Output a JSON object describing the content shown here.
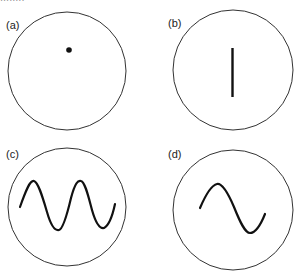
{
  "figure": {
    "cut_text": "........",
    "panels": [
      {
        "id": "a",
        "label": "(a)",
        "display": "dot"
      },
      {
        "id": "b",
        "label": "(b)",
        "display": "vertical-line"
      },
      {
        "id": "c",
        "label": "(c)",
        "display": "sine-wave-two-cycles"
      },
      {
        "id": "d",
        "label": "(d)",
        "display": "sine-wave-one-cycle"
      }
    ],
    "colors": {
      "stroke": "#1a1a1a",
      "circle": "#333333",
      "background": "#ffffff"
    }
  }
}
